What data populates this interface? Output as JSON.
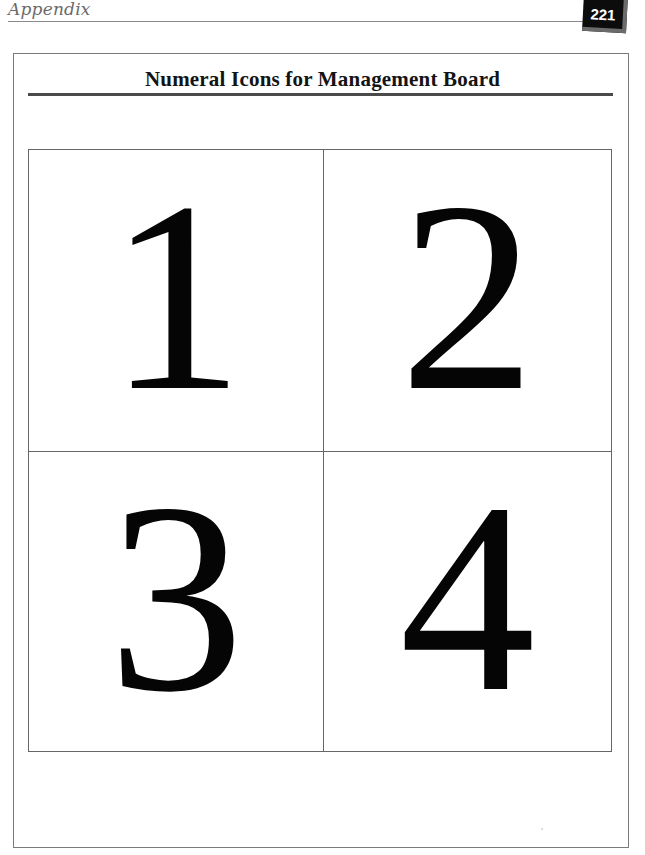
{
  "header": {
    "section_label": "Appendix",
    "page_number": "221"
  },
  "content": {
    "title": "Numeral Icons for Management Board",
    "numerals": [
      {
        "value": "1"
      },
      {
        "value": "2"
      },
      {
        "value": "3"
      },
      {
        "value": "4"
      }
    ]
  },
  "colors": {
    "badge_background": "#0c0c0c",
    "badge_text": "#ffffff",
    "title_rule": "#4a4a4a",
    "grid_lines": "#666666"
  }
}
